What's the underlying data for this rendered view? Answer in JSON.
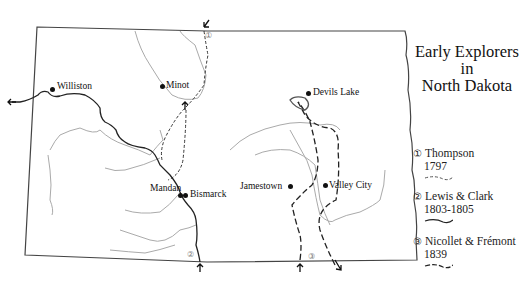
{
  "title": {
    "line1": "Early Explorers",
    "line2": "in",
    "line3": "North Dakota"
  },
  "legend": [
    {
      "number": "①",
      "name": "Thompson",
      "years": "1797",
      "line_style": "short-dash"
    },
    {
      "number": "②",
      "name": "Lewis & Clark",
      "years": "1803-1805",
      "line_style": "solid"
    },
    {
      "number": "③",
      "name": "Nicollet & Frémont",
      "years": "1839",
      "line_style": "long-dash"
    }
  ],
  "cities": [
    {
      "name": "Williston"
    },
    {
      "name": "Minot"
    },
    {
      "name": "Devils Lake"
    },
    {
      "name": "Mandan"
    },
    {
      "name": "Bismarck"
    },
    {
      "name": "Jamestown"
    },
    {
      "name": "Valley City"
    }
  ],
  "route_markers": {
    "thompson": "①",
    "lewis_clark": "②",
    "nicollet_fremont": "③"
  },
  "colors": {
    "border": "#333333",
    "river": "#a8a8a8",
    "route": "#222222",
    "text": "#111111"
  }
}
